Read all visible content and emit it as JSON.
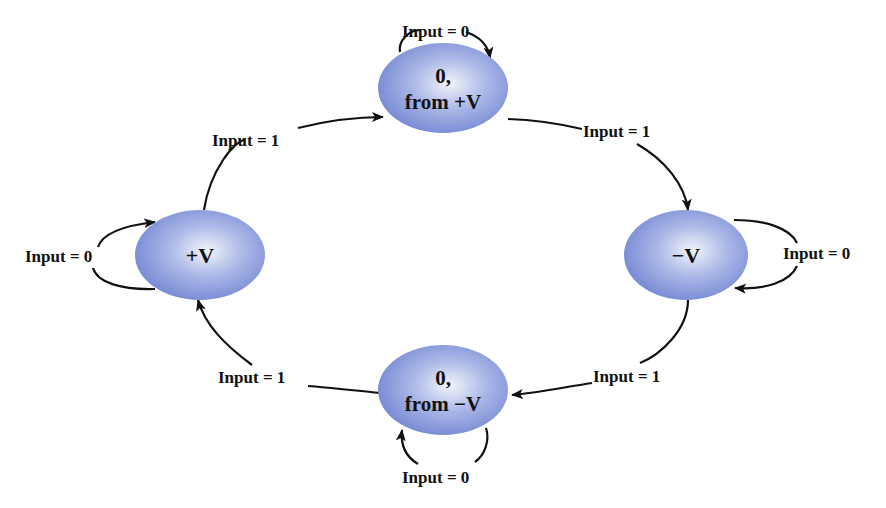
{
  "diagram": {
    "type": "state-machine",
    "colors": {
      "node_fill_light": "#f2f4fb",
      "node_fill_mid": "#a9b6e6",
      "node_fill_dark": "#6a7fd0",
      "edge": "#111111",
      "text": "#111111",
      "background": "#ffffff"
    },
    "nodes": [
      {
        "id": "zero_from_pos",
        "line1": "0,",
        "line2": "from +V"
      },
      {
        "id": "pos_v",
        "line1": "+V"
      },
      {
        "id": "neg_v",
        "line1": "−V"
      },
      {
        "id": "zero_from_neg",
        "line1": "0,",
        "line2": "from −V"
      }
    ],
    "edges": [
      {
        "from": "pos_v",
        "to": "zero_from_pos",
        "label": "Input = 1"
      },
      {
        "from": "zero_from_pos",
        "to": "neg_v",
        "label": "Input = 1"
      },
      {
        "from": "neg_v",
        "to": "zero_from_neg",
        "label": "Input = 1"
      },
      {
        "from": "zero_from_neg",
        "to": "pos_v",
        "label": "Input = 1"
      },
      {
        "from": "zero_from_pos",
        "to": "zero_from_pos",
        "label": "Input = 0"
      },
      {
        "from": "pos_v",
        "to": "pos_v",
        "label": "Input = 0"
      },
      {
        "from": "neg_v",
        "to": "neg_v",
        "label": "Input = 0"
      },
      {
        "from": "zero_from_neg",
        "to": "zero_from_neg",
        "label": "Input = 0"
      }
    ]
  }
}
